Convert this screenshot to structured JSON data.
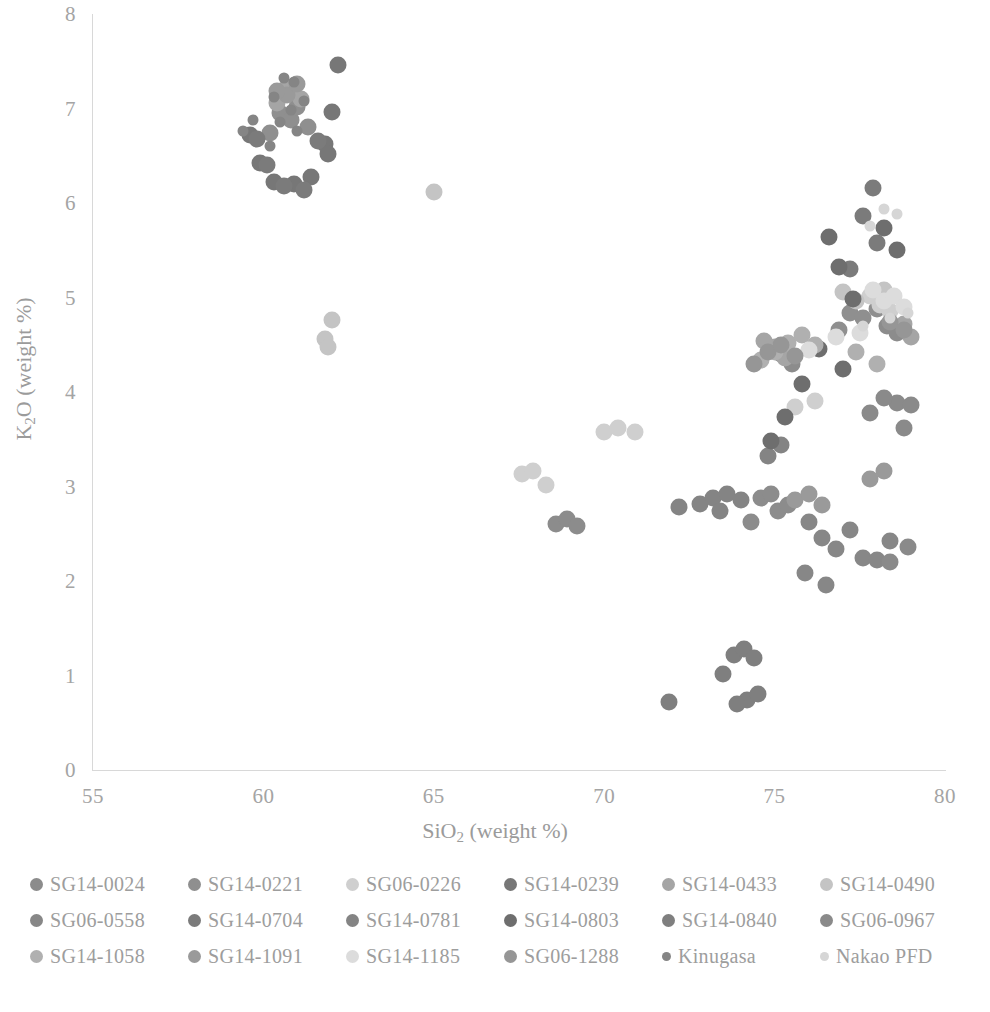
{
  "chart_data": {
    "type": "scatter",
    "title": "",
    "xlabel": "SiO2 (weight %)",
    "ylabel": "K2O (weight %)",
    "xlabel_html": "SiO<sub>2</sub> (weight %)",
    "ylabel_html": "K<sub>2</sub>O (weight %)",
    "xlim": [
      55,
      80
    ],
    "ylim": [
      0,
      8
    ],
    "xticks": [
      "55",
      "60",
      "65",
      "70",
      "75",
      "80"
    ],
    "yticks": [
      "8",
      "7",
      "6",
      "5",
      "4",
      "3",
      "2",
      "1",
      "0"
    ],
    "grid": false,
    "legend_position": "below-plot",
    "marker": "filled-circle",
    "series": [
      {
        "name": "SG14-0024",
        "color": "#8c8c8c",
        "points": [
          [
            74.6,
            2.88
          ],
          [
            74.9,
            2.92
          ],
          [
            75.1,
            2.74
          ],
          [
            74.3,
            2.62
          ],
          [
            75.4,
            2.8
          ],
          [
            68.6,
            2.6
          ],
          [
            68.9,
            2.66
          ],
          [
            69.2,
            2.58
          ],
          [
            75.2,
            4.4
          ],
          [
            74.9,
            4.46
          ],
          [
            75.5,
            4.3
          ],
          [
            78.3,
            4.7
          ],
          [
            78.6,
            4.62
          ]
        ]
      },
      {
        "name": "SG14-0221",
        "color": "#8f8f8f",
        "points": [
          [
            60.5,
            6.95
          ],
          [
            60.8,
            6.88
          ],
          [
            61.0,
            7.02
          ],
          [
            60.2,
            6.74
          ],
          [
            61.3,
            6.8
          ],
          [
            77.2,
            4.84
          ],
          [
            77.6,
            4.78
          ],
          [
            78.0,
            4.88
          ],
          [
            76.9,
            4.66
          ]
        ]
      },
      {
        "name": "SG06-0226",
        "color": "#cfcfcf",
        "points": [
          [
            67.6,
            3.13
          ],
          [
            67.9,
            3.16
          ],
          [
            68.3,
            3.02
          ],
          [
            70.0,
            3.58
          ],
          [
            70.4,
            3.62
          ],
          [
            70.9,
            3.58
          ],
          [
            75.6,
            3.84
          ],
          [
            76.2,
            3.9
          ],
          [
            78.1,
            4.92
          ],
          [
            78.4,
            4.86
          ],
          [
            77.8,
            5.02
          ]
        ]
      },
      {
        "name": "SG14-0239",
        "color": "#777777",
        "points": [
          [
            59.6,
            6.72
          ],
          [
            59.9,
            6.42
          ],
          [
            60.3,
            6.22
          ],
          [
            60.9,
            6.2
          ],
          [
            61.4,
            6.28
          ],
          [
            61.8,
            6.62
          ],
          [
            62.0,
            6.96
          ],
          [
            62.2,
            7.46
          ],
          [
            61.9,
            6.52
          ]
        ]
      },
      {
        "name": "SG14-0433",
        "color": "#a5a5a5",
        "points": [
          [
            60.6,
            7.2
          ],
          [
            60.9,
            7.24
          ],
          [
            61.1,
            7.1
          ],
          [
            60.4,
            7.06
          ],
          [
            75.0,
            4.48
          ],
          [
            75.3,
            4.36
          ],
          [
            74.7,
            4.54
          ],
          [
            78.8,
            4.72
          ],
          [
            79.0,
            4.58
          ]
        ]
      },
      {
        "name": "SG14-0490",
        "color": "#c4c4c4",
        "points": [
          [
            62.0,
            4.76
          ],
          [
            61.8,
            4.56
          ],
          [
            61.9,
            4.48
          ],
          [
            65.0,
            6.12
          ],
          [
            77.4,
            4.96
          ],
          [
            77.0,
            5.06
          ],
          [
            78.2,
            5.08
          ]
        ]
      },
      {
        "name": "SG06-0558",
        "color": "#878787",
        "points": [
          [
            76.4,
            2.46
          ],
          [
            76.8,
            2.34
          ],
          [
            77.2,
            2.54
          ],
          [
            77.6,
            2.24
          ],
          [
            76.0,
            2.62
          ],
          [
            75.9,
            2.08
          ],
          [
            76.5,
            1.96
          ],
          [
            78.4,
            2.42
          ],
          [
            78.0,
            2.22
          ]
        ]
      },
      {
        "name": "SG14-0704",
        "color": "#7b7b7b",
        "points": [
          [
            59.8,
            6.68
          ],
          [
            60.1,
            6.4
          ],
          [
            60.6,
            6.18
          ],
          [
            61.2,
            6.14
          ],
          [
            61.6,
            6.66
          ],
          [
            77.9,
            6.16
          ],
          [
            77.6,
            5.86
          ],
          [
            78.0,
            5.58
          ],
          [
            77.2,
            5.3
          ]
        ]
      },
      {
        "name": "SG14-0781",
        "color": "#848484",
        "points": [
          [
            72.8,
            2.82
          ],
          [
            73.2,
            2.88
          ],
          [
            73.6,
            2.92
          ],
          [
            74.0,
            2.86
          ],
          [
            73.4,
            2.74
          ],
          [
            72.2,
            2.78
          ],
          [
            74.8,
            3.32
          ],
          [
            75.2,
            3.44
          ]
        ]
      },
      {
        "name": "SG14-0803",
        "color": "#6e6e6e",
        "points": [
          [
            76.6,
            5.64
          ],
          [
            76.9,
            5.32
          ],
          [
            77.3,
            4.98
          ],
          [
            77.0,
            4.24
          ],
          [
            76.3,
            4.46
          ],
          [
            75.8,
            4.08
          ],
          [
            75.3,
            3.74
          ],
          [
            74.9,
            3.48
          ],
          [
            78.2,
            5.74
          ],
          [
            78.6,
            5.5
          ]
        ]
      },
      {
        "name": "SG14-0840",
        "color": "#7f7f7f",
        "points": [
          [
            73.8,
            1.22
          ],
          [
            74.1,
            1.28
          ],
          [
            74.4,
            1.18
          ],
          [
            73.5,
            1.02
          ],
          [
            74.2,
            0.74
          ],
          [
            74.5,
            0.8
          ],
          [
            73.9,
            0.7
          ],
          [
            71.9,
            0.72
          ]
        ]
      },
      {
        "name": "SG06-0967",
        "color": "#8a8a8a",
        "points": [
          [
            78.6,
            3.88
          ],
          [
            78.2,
            3.94
          ],
          [
            77.8,
            3.78
          ],
          [
            79.0,
            3.86
          ],
          [
            78.8,
            3.62
          ],
          [
            78.4,
            2.2
          ],
          [
            78.9,
            2.36
          ]
        ]
      },
      {
        "name": "SG14-1058",
        "color": "#b0b0b0",
        "points": [
          [
            75.4,
            4.52
          ],
          [
            75.0,
            4.42
          ],
          [
            74.6,
            4.34
          ],
          [
            75.8,
            4.6
          ],
          [
            76.2,
            4.5
          ],
          [
            77.4,
            4.42
          ],
          [
            78.0,
            4.3
          ]
        ]
      },
      {
        "name": "SG14-1091",
        "color": "#9a9a9a",
        "points": [
          [
            60.7,
            7.14
          ],
          [
            60.4,
            7.18
          ],
          [
            61.0,
            7.26
          ],
          [
            75.6,
            2.86
          ],
          [
            76.0,
            2.92
          ],
          [
            76.4,
            2.8
          ],
          [
            77.8,
            3.08
          ],
          [
            78.2,
            3.16
          ]
        ]
      },
      {
        "name": "SG14-1185",
        "color": "#dcdcdc",
        "points": [
          [
            78.2,
            4.96
          ],
          [
            78.5,
            5.02
          ],
          [
            77.9,
            5.08
          ],
          [
            78.8,
            4.9
          ],
          [
            77.5,
            4.62
          ],
          [
            76.8,
            4.58
          ],
          [
            76.0,
            4.44
          ]
        ]
      },
      {
        "name": "SG06-1288",
        "color": "#969696",
        "points": [
          [
            74.8,
            4.42
          ],
          [
            75.2,
            4.5
          ],
          [
            75.6,
            4.38
          ],
          [
            74.4,
            4.3
          ],
          [
            78.4,
            4.74
          ],
          [
            78.8,
            4.66
          ]
        ]
      },
      {
        "name": "Kinugasa",
        "color": "#858585",
        "marker_size": "small",
        "points": [
          [
            60.6,
            7.32
          ],
          [
            60.9,
            7.28
          ],
          [
            61.2,
            7.08
          ],
          [
            60.3,
            7.12
          ],
          [
            60.5,
            6.86
          ],
          [
            60.8,
            6.98
          ],
          [
            61.0,
            6.76
          ],
          [
            60.2,
            6.6
          ],
          [
            59.4,
            6.76
          ],
          [
            59.7,
            6.88
          ]
        ]
      },
      {
        "name": "Nakao PFD",
        "color": "#d6d6d6",
        "marker_size": "small",
        "points": [
          [
            78.2,
            5.94
          ],
          [
            78.6,
            5.88
          ],
          [
            77.8,
            5.76
          ],
          [
            78.4,
            4.78
          ],
          [
            78.9,
            4.84
          ],
          [
            77.6,
            4.7
          ]
        ]
      }
    ]
  },
  "axes": {
    "x": {
      "title_prefix": "SiO",
      "title_sub": "2",
      "title_suffix": " (weight %)",
      "ticks": [
        "55",
        "60",
        "65",
        "70",
        "75",
        "80"
      ]
    },
    "y": {
      "title_prefix": "K",
      "title_sub": "2",
      "title_suffix": "O (weight %)",
      "ticks": [
        "8",
        "7",
        "6",
        "5",
        "4",
        "3",
        "2",
        "1",
        "0"
      ]
    }
  },
  "legend": {
    "rows": [
      [
        {
          "label": "SG14-0024",
          "color": "#8c8c8c",
          "size": "normal"
        },
        {
          "label": "SG14-0221",
          "color": "#8f8f8f",
          "size": "normal"
        },
        {
          "label": "SG06-0226",
          "color": "#cfcfcf",
          "size": "normal"
        },
        {
          "label": "SG14-0239",
          "color": "#777777",
          "size": "normal"
        },
        {
          "label": "SG14-0433",
          "color": "#a5a5a5",
          "size": "normal"
        },
        {
          "label": "SG14-0490",
          "color": "#c4c4c4",
          "size": "normal"
        }
      ],
      [
        {
          "label": "SG06-0558",
          "color": "#878787",
          "size": "normal"
        },
        {
          "label": "SG14-0704",
          "color": "#7b7b7b",
          "size": "normal"
        },
        {
          "label": "SG14-0781",
          "color": "#848484",
          "size": "normal"
        },
        {
          "label": "SG14-0803",
          "color": "#6e6e6e",
          "size": "normal"
        },
        {
          "label": "SG14-0840",
          "color": "#7f7f7f",
          "size": "normal"
        },
        {
          "label": "SG06-0967",
          "color": "#8a8a8a",
          "size": "normal"
        }
      ],
      [
        {
          "label": "SG14-1058",
          "color": "#b0b0b0",
          "size": "normal"
        },
        {
          "label": "SG14-1091",
          "color": "#9a9a9a",
          "size": "normal"
        },
        {
          "label": "SG14-1185",
          "color": "#dcdcdc",
          "size": "normal"
        },
        {
          "label": "SG06-1288",
          "color": "#969696",
          "size": "normal"
        },
        {
          "label": "Kinugasa",
          "color": "#858585",
          "size": "small"
        },
        {
          "label": "Nakao PFD",
          "color": "#d6d6d6",
          "size": "small"
        }
      ]
    ]
  },
  "colors": {
    "axis_line": "#d8d8d8",
    "tick_text": "#a4a4a4",
    "axis_title": "#9b9b9b",
    "legend_text": "#9d9d9d",
    "background": "#ffffff"
  }
}
